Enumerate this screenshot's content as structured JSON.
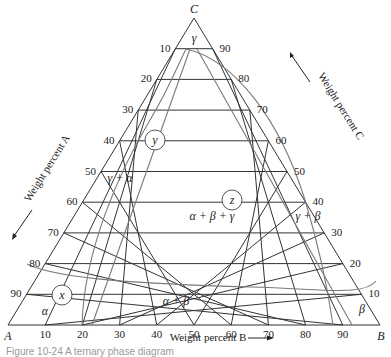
{
  "diagram": {
    "title": "Ternary phase diagram",
    "vertices": {
      "A": "A",
      "B": "B",
      "C": "C"
    },
    "axes": {
      "left": {
        "label": "Weight percent A",
        "ticks": [
          "10",
          "20",
          "30",
          "40",
          "50",
          "60",
          "70",
          "80",
          "90"
        ]
      },
      "right": {
        "label": "Weight percent C",
        "ticks": [
          "90",
          "80",
          "70",
          "60",
          "50",
          "40",
          "30",
          "20",
          "10"
        ]
      },
      "bottom": {
        "label": "Weight percent B",
        "ticks": [
          "10",
          "20",
          "30",
          "40",
          "50",
          "60",
          "70",
          "80",
          "90"
        ]
      }
    },
    "phase_regions": [
      {
        "name": "gamma",
        "label": "γ"
      },
      {
        "name": "gamma-alpha",
        "label": "γ + α"
      },
      {
        "name": "alpha-beta-gamma",
        "label": "α + β + γ"
      },
      {
        "name": "gamma-beta",
        "label": "γ + β"
      },
      {
        "name": "alpha-beta",
        "label": "α + β"
      },
      {
        "name": "alpha",
        "label": "α"
      },
      {
        "name": "beta",
        "label": "β"
      }
    ],
    "points": [
      {
        "name": "x",
        "label": "x"
      },
      {
        "name": "y",
        "label": "y"
      },
      {
        "name": "z",
        "label": "z"
      }
    ],
    "colors": {
      "grid": "#333333",
      "boundary": "#777777",
      "text": "#222222"
    }
  },
  "caption": "Figure 10-24  A ternary phase diagram"
}
